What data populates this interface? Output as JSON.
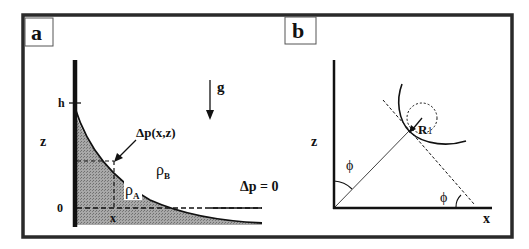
{
  "figure": {
    "panels": [
      {
        "id": "a",
        "label": "a",
        "gravity_label": "g",
        "axis_z_label": "z",
        "tick_h_label": "h",
        "tick_zero_label": "0",
        "tick_x_label": "x",
        "pressure_point_label": "Δp(x,z)",
        "density_A_label": "ρ",
        "density_A_sub": "A",
        "density_B_label": "ρ",
        "density_B_sub": "B",
        "far_field_label": "Δp = 0"
      },
      {
        "id": "b",
        "label": "b",
        "axis_z_label": "z",
        "axis_x_label": "x",
        "angle_label_1": "ϕ",
        "angle_label_2": "ϕ",
        "radius_label": "R",
        "radius_sub": "1"
      }
    ],
    "colors": {
      "frame": "#2a2a2a",
      "ink": "#111111",
      "fill_A": "#9a9a9a",
      "background": "#ffffff"
    }
  }
}
